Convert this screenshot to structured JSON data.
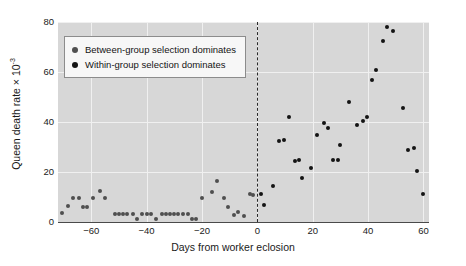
{
  "chart_data": {
    "type": "scatter",
    "title": "",
    "xlabel": "Days from worker eclosion",
    "ylabel": "Queen death rate × 10",
    "ylabel_exponent": "-3",
    "xlim": [
      -72,
      62
    ],
    "ylim": [
      0,
      80
    ],
    "xticks": [
      -60,
      -40,
      -20,
      0,
      20,
      40,
      60
    ],
    "yticks": [
      0,
      20,
      40,
      60,
      80
    ],
    "grid": true,
    "legend_position": "top-left",
    "annotations": [
      {
        "type": "vline",
        "x": 0,
        "style": "dashed",
        "label": "worker eclosion"
      }
    ],
    "series": [
      {
        "name": "Between-group selection dominates",
        "color": "#4f4f4f",
        "points": [
          [
            -70.5,
            3.5
          ],
          [
            -68.5,
            6.5
          ],
          [
            -66.5,
            9.8
          ],
          [
            -64.5,
            9.8
          ],
          [
            -63.0,
            6.2
          ],
          [
            -61.5,
            6.2
          ],
          [
            -59.5,
            9.8
          ],
          [
            -57.0,
            12.3
          ],
          [
            -55.0,
            9.8
          ],
          [
            -51.5,
            3.4
          ],
          [
            -50.0,
            3.4
          ],
          [
            -48.5,
            3.4
          ],
          [
            -47.0,
            3.4
          ],
          [
            -45.0,
            3.4
          ],
          [
            -43.5,
            1.4
          ],
          [
            -41.5,
            3.4
          ],
          [
            -40.0,
            3.4
          ],
          [
            -38.5,
            3.4
          ],
          [
            -36.5,
            1.4
          ],
          [
            -34.5,
            3.4
          ],
          [
            -33.0,
            3.4
          ],
          [
            -31.5,
            3.4
          ],
          [
            -30.0,
            3.4
          ],
          [
            -28.5,
            3.4
          ],
          [
            -27.0,
            3.4
          ],
          [
            -25.0,
            3.4
          ],
          [
            -23.5,
            1.4
          ],
          [
            -22.0,
            1.4
          ],
          [
            -20.0,
            9.6
          ],
          [
            -16.5,
            12.2
          ],
          [
            -14.5,
            16.3
          ],
          [
            -12.0,
            9.8
          ],
          [
            -10.5,
            6.0
          ],
          [
            -8.5,
            2.8
          ],
          [
            -7.0,
            4.2
          ],
          [
            -5.0,
            2.6
          ],
          [
            -2.5,
            11.3
          ],
          [
            -1.5,
            11.0
          ]
        ]
      },
      {
        "name": "Within-group selection dominates",
        "color": "#141414",
        "points": [
          [
            1.5,
            11.2
          ],
          [
            2.5,
            6.8
          ],
          [
            5.5,
            14.5
          ],
          [
            8.0,
            32.5
          ],
          [
            9.5,
            33.0
          ],
          [
            11.5,
            42.0
          ],
          [
            13.5,
            24.5
          ],
          [
            15.0,
            24.8
          ],
          [
            16.0,
            17.8
          ],
          [
            19.5,
            21.5
          ],
          [
            21.5,
            34.8
          ],
          [
            24.0,
            39.5
          ],
          [
            25.5,
            37.8
          ],
          [
            27.5,
            24.8
          ],
          [
            29.0,
            25.0
          ],
          [
            30.0,
            31.0
          ],
          [
            33.0,
            48.0
          ],
          [
            36.0,
            38.8
          ],
          [
            38.0,
            40.5
          ],
          [
            39.5,
            42.2
          ],
          [
            41.5,
            57.0
          ],
          [
            43.0,
            61.0
          ],
          [
            45.5,
            72.5
          ],
          [
            47.0,
            78.0
          ],
          [
            49.0,
            76.5
          ],
          [
            52.5,
            45.5
          ],
          [
            54.5,
            28.8
          ],
          [
            56.5,
            29.5
          ],
          [
            57.5,
            20.3
          ],
          [
            60.0,
            11.3
          ]
        ]
      }
    ]
  },
  "legend": {
    "items": [
      {
        "label": "Between-group selection dominates",
        "marker": "filled-circle-gray"
      },
      {
        "label": "Within-group selection dominates",
        "marker": "filled-circle-black"
      }
    ]
  },
  "axes": {
    "x_tick_labels": [
      "−60",
      "−40",
      "−20",
      "0",
      "20",
      "40",
      "60"
    ],
    "y_tick_labels": [
      "0",
      "20",
      "40",
      "60",
      "80"
    ]
  },
  "colors": {
    "panel_background": "#d7d7d7",
    "gridline": "#f0f0f0",
    "axis_line": "#4a4a4a",
    "between_group": "#4f4f4f",
    "within_group": "#141414",
    "figure_background": "#ffffff"
  }
}
